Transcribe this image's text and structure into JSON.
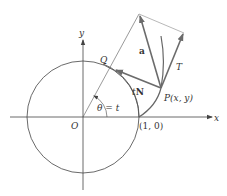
{
  "diagram": {
    "type": "involute-of-circle",
    "labels": {
      "x_axis": "x",
      "y_axis": "y",
      "origin": "O",
      "point_q": "Q",
      "point_p": "P(x, y)",
      "point_one_zero": "(1, 0)",
      "angle": "θ = t",
      "vector_a": "a",
      "vector_t": "T",
      "vector_tn_prefix": "t",
      "vector_tn_bold": "N"
    },
    "colors": {
      "thin_line": "#555555",
      "vector": "#6b6b6b",
      "text": "#333333",
      "background": "#ffffff"
    }
  }
}
